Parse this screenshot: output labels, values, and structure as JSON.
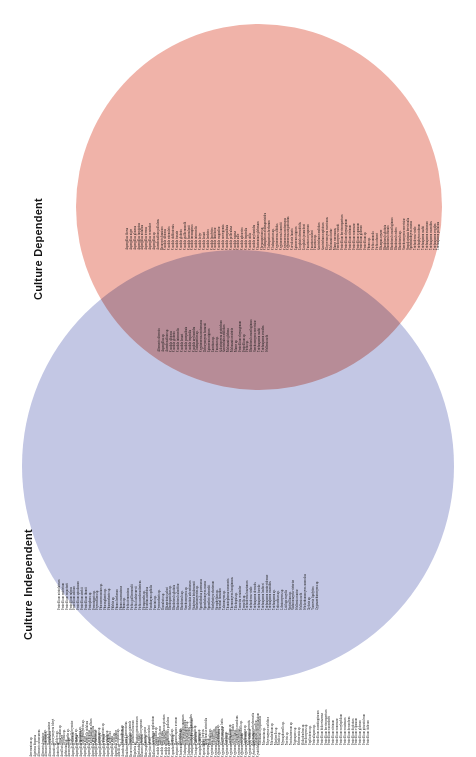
{
  "labels": {
    "dependent": "Culture Dependent",
    "independent": "Culture Independent"
  },
  "colors": {
    "dependent_fill": "#f0b3a9",
    "independent_fill": "#c3c7e4",
    "overlap_fill": "#ce8a93",
    "text": "#1a1a1a",
    "label_text": "#111111",
    "background": "#ffffff"
  },
  "chart_data": {
    "type": "venn",
    "title": "",
    "sets": [
      {
        "name": "Culture Dependent",
        "color": "#f0b3a9",
        "count": 74
      },
      {
        "name": "Culture Independent",
        "color": "#c3c7e4",
        "count": 205
      }
    ],
    "intersection_count": 29,
    "legend_position": "left-rotated"
  },
  "sets": {
    "dependent_only": [
      "Aspergillus flavus",
      "Aspergillus niger",
      "Aspergillus glaucus",
      "Aspergillus fumigatus",
      "Aspergillus nidulans",
      "Aspergillus terreus",
      "Aspergillus versicolor",
      "Aspergillus sp.",
      "Aureobasidium pullulans",
      "Beauveria bassiana",
      "Candida albicans",
      "Candida catenulata",
      "Candida dubliniensis",
      "Candida famata",
      "Candida glabrata",
      "Candida guilliermondii",
      "Candida haemulonii",
      "Candida inconspicua",
      "Candida intermedia",
      "Candida kefyr",
      "Candida krusei",
      "Candida lambica",
      "Candida lipolytica",
      "Candida lusitaniae",
      "Candida magnoliae",
      "Candida norvegensis",
      "Candida parapsilosis",
      "Candida pelliculosa",
      "Candida rugosa",
      "Candida sake",
      "Candida sphaerica",
      "Candida tropicalis",
      "Candida utilis",
      "Candida zeylanoides",
      "Chaetomium globosum",
      "Chrysosporium sp.",
      "Cladosporium cladosporioides",
      "Cladosporium herbarum",
      "Cladosporium sp.",
      "Cryptococcus albidus",
      "Cryptococcus laurentii",
      "Cryptococcus neoformans",
      "Cryptococcus uniguttulatus",
      "Curvularia lunata",
      "Epicoccum nigrum",
      "Exophiala dermatitidis",
      "Exophiala jeanselmei",
      "Fusarium oxysporum",
      "Fusarium solani",
      "Fusarium sp.",
      "Geotrichum candidum",
      "Geotrichum capitatum",
      "Kluyveromyces marxianus",
      "Malassezia furfur",
      "Mucor racemosus",
      "Paecilomyces variotii",
      "Penicillium brevicompactum",
      "Penicillium chrysogenum",
      "Penicillium citrinum",
      "Penicillium commune",
      "Penicillium expansum",
      "Penicillium glabrum",
      "Penicillium sp.",
      "Phoma sp.",
      "Pichia anomala",
      "Pichia ohmeri",
      "Rhizopus oryzae",
      "Rhodotorula glutinis",
      "Rhodotorula minuta",
      "Rhodotorula mucilaginosa",
      "Rhodotorula rubra",
      "Rhodotorula sp.",
      "Saccharomyces cerevisiae",
      "Scopulariopsis brevicaulis",
      "Sporobolomyces roseus",
      "Trichoderma viride",
      "Trichophyton rubrum",
      "Trichosporon asahii",
      "Trichosporon cutaneum",
      "Trichosporon mucoides",
      "Trichosporon ovoides",
      "Trichosporon pullulans"
    ],
    "shared": [
      "Alternaria alternata",
      "Aspergillus sp.",
      "Aureobasidium sp.",
      "Candida albicans",
      "Candida glabrata",
      "Candida intermedia",
      "Candida krusei",
      "Candida parapsilosis",
      "Candida tropicalis",
      "Candida zeylanoides",
      "Cladosporium sp.",
      "Cryptococcus neoformans",
      "Debaryomyces hansenii",
      "Epicoccum nigrum",
      "Eurotium sp.",
      "Fusarium sp.",
      "Galactomyces geotrichum",
      "Geotrichum candidum",
      "Malassezia globosa",
      "Malassezia restricta",
      "Mucor sp.",
      "Penicillium chrysogenum",
      "Penicillium sp.",
      "Pichia sp.",
      "Rhodotorula mucilaginosa",
      "Saccharomyces cerevisiae",
      "Trichosporon asahii",
      "Trichosporon ovoides",
      "Wallemia sebi"
    ],
    "independent_only_row1": [
      "Penicillium minioluteum",
      "Penicillium restrictum",
      "Penicillium roqueforti",
      "Penicillium rubens",
      "Penicillium solitum",
      "Penicillium spinulosum",
      "Penicillium steckii",
      "Penicillium thomii",
      "Peniophora sp.",
      "Perenniporia sp.",
      "Peyronellaea sp.",
      "Phaeoacremonium sp.",
      "Phaeosphaeria sp.",
      "Phanerochaete sp.",
      "Phlebia sp.",
      "Phoma herbarum",
      "Phoma macrostoma",
      "Phoma sp.",
      "Pichia fermentans",
      "Pichia guilliermondii",
      "Pichia kudriavzevii",
      "Pichia membranifaciens",
      "Pleosporales sp.",
      "Pleurotus ostreatus",
      "Pseudozyma aphidis",
      "Puccinia sp.",
      "Pyrenochaeta sp.",
      "Ramularia sp.",
      "Rhizoctonia solani",
      "Rhodosporidium sp.",
      "Rhodotorula glutinis",
      "Rhodotorula slooffiae",
      "Rhodotorula sp.",
      "Saccharomyces sp.",
      "Sclerotinia sclerotiorum",
      "Sistotrema brinkmannii",
      "Sordariomycetes sp.",
      "Sporidiobolus pararoseus",
      "Sporobolomyces roseus",
      "Sporothrix schenckii",
      "Stachybotrys chartarum",
      "Stemphylium sp.",
      "Stereum hirsutum",
      "Talaromyces sp.",
      "Thanatephorus cucumeris",
      "Thermomyces lanuginosus",
      "Tilletiopsis sp.",
      "Trametes versicolor",
      "Tremella sp.",
      "Trichoderma harzianum",
      "Trichoderma viride",
      "Trichosporon dermatis",
      "Trichosporon faecale",
      "Trichosporon loubieri",
      "Trichosporon montevideense",
      "Trichosporon mucoides",
      "Trichosporon sp.",
      "Tritirachium sp.",
      "Udeniomyces sp.",
      "Ustilago maydis",
      "Verticillium sp.",
      "Vishniacozyma victoriae",
      "Wallemia muriae",
      "Wallemia sebi",
      "Wickerhamomyces anomalus",
      "Xylaria sp.",
      "Yarrowia lipolytica",
      "Zygosaccharomyces sp."
    ],
    "independent_only_row2": [
      "Daedalea sp.",
      "Davidiella tassiana",
      "Debaryomyces fabryi",
      "Dekkera sp.",
      "Dendryphion sp.",
      "Devriesia sp.",
      "Diaporthe sp.",
      "Didymella bryoniae",
      "Dioszegia sp.",
      "Dipodascus sp.",
      "Dothideomycetes sp.",
      "Emericella nidulans",
      "Engyodontium album",
      "Entoloma sp.",
      "Epicoccum sp.",
      "Eremothecium sp.",
      "Erysiphe sp.",
      "Eutypa lata",
      "Exidia sp.",
      "Exophiala sp.",
      "Filobasidium sp.",
      "Fomes fomentarius",
      "Fomitopsis pinicola",
      "Fusarium culmorum",
      "Fusarium graminearum",
      "Fusarium oxysporum",
      "Fusarium poae",
      "Fusarium solani",
      "Ganoderma applanatum",
      "Geosmithia sp.",
      "Gibberella zeae",
      "Gloeophyllum sepiarium",
      "Guehomyces pullulans",
      "Hannaella sp.",
      "Hanseniaspora uvarum",
      "Helotiales sp.",
      "Heterobasidion annosum",
      "Holtermanniella sp.",
      "Hormonema dematioides",
      "Hyphodontia sp.",
      "Hypocrea sp.",
      "Irpex lacteus",
      "Issatchenkia orientalis",
      "Itersonilia sp.",
      "Kabatiella sp.",
      "Kazachstania sp.",
      "Kluyveromyces lactis",
      "Kondoa sp.",
      "Lecanicillium sp.",
      "Lentinula edodes",
      "Leptosphaeria maculans",
      "Leucosporidiella sp.",
      "Lophiostoma sp.",
      "Malassezia dermatis",
      "Malassezia pachydermatis",
      "Malassezia slooffiae",
      "Malassezia sympodialis",
      "Marasmius sp.",
      "Meyerozyma caribbica",
      "Microdochium sp.",
      "Mortierella sp.",
      "Mrakia sp.",
      "Mycosphaerella sp.",
      "Nectria sp.",
      "Neofusicoccum sp.",
      "Nigrospora sp.",
      "Ochroconis sp.",
      "Oidiodendron sp.",
      "Paecilomyces sp.",
      "Papiliotrema sp.",
      "Peniculispora sp.",
      "Penicillium aurantiogriseum",
      "Penicillium bialowiezense",
      "Penicillium brevicompactum",
      "Penicillium camemberti",
      "Penicillium citrinum",
      "Penicillium commune",
      "Penicillium corylophilum",
      "Penicillium crustosum",
      "Penicillium decumbens",
      "Penicillium digitatum",
      "Penicillium expansum",
      "Penicillium glabrum",
      "Penicillium griseofulvum",
      "Penicillium italicum"
    ],
    "independent_only_row3": [
      "Acremonium sp.",
      "Agaricus bisporus",
      "Alternaria arborescens",
      "Alternaria brassicae",
      "Alternaria infectoria",
      "Alternaria tenuissima",
      "Amanita sp.",
      "Antrodia sp.",
      "Armillaria mellea",
      "Arthrinium sp.",
      "Ascomycota sp.",
      "Aspergillus clavatus",
      "Aspergillus flavus",
      "Aspergillus fumigatus",
      "Aspergillus niger",
      "Aspergillus ochraceus",
      "Aspergillus penicillioides",
      "Aspergillus restrictus",
      "Aspergillus sydowii",
      "Aspergillus terreus",
      "Aspergillus unguis",
      "Aspergillus ustus",
      "Aspergillus versicolor",
      "Athelia sp.",
      "Aureobasidium pullulans",
      "Basidiomycota sp.",
      "Beauveria bassiana",
      "Bipolaris sp.",
      "Bjerkandera adusta",
      "Blumeria graminis",
      "Botryosphaeria sp.",
      "Botrytis cinerea",
      "Bulleromyces albus",
      "Candida boidinii",
      "Candida dubliniensis",
      "Candida orthopsilosis",
      "Candida sake",
      "Capnobotryella sp.",
      "Ceriporia sp.",
      "Chaetomium globosum",
      "Cladosporium cladosporioides",
      "Cladosporium herbarum",
      "Cladosporium sphaerospermum",
      "Clavispora lusitaniae",
      "Coniophora puteana",
      "Coprinellus sp.",
      "Coprinopsis sp.",
      "Cryptococcus albidus",
      "Cryptococcus carnescens",
      "Cryptococcus diffluens",
      "Cryptococcus flavescens",
      "Cryptococcus gattii",
      "Cryptococcus laurentii",
      "Cryptococcus magnus",
      "Cryptococcus oeirensis",
      "Cryptococcus saitoi",
      "Cryptococcus terreus",
      "Cryptococcus victoriae",
      "Cyberlindnera jadinii",
      "Cystofilobasidium infirmominiatum"
    ]
  }
}
